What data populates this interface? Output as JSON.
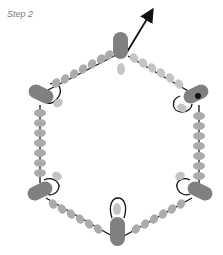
{
  "diagram": {
    "step_label": "Step 2",
    "shape": "hexagon",
    "colors": {
      "seed_bead": "#ababab",
      "seed_bead_light": "#c4c4c4",
      "dagger_bead": "#808080",
      "thread": "#111111",
      "background": "#ffffff"
    },
    "corners": [
      "top",
      "top-right",
      "bottom-right",
      "bottom",
      "bottom-left",
      "top-left"
    ],
    "exit_arrow": "thread exits upward-right from top corner"
  }
}
